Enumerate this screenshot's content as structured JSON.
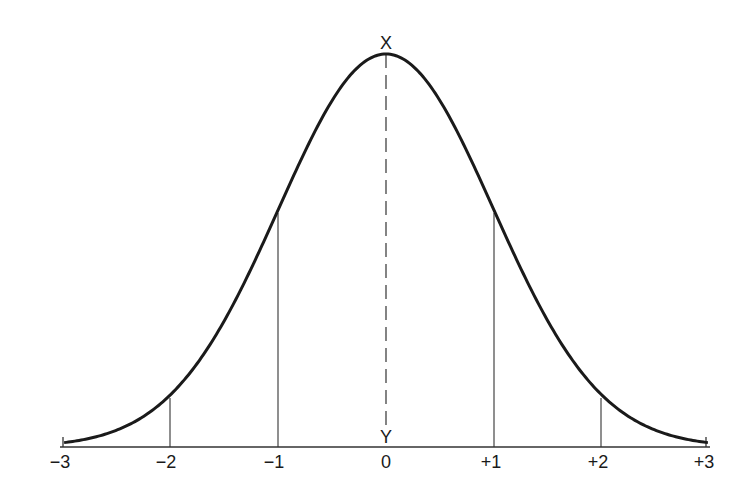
{
  "diagram": {
    "peak_label": "X",
    "baseline_label": "Y",
    "ticks": [
      {
        "label": "−3",
        "value": -3
      },
      {
        "label": "−2",
        "value": -2
      },
      {
        "label": "−1",
        "value": -1
      },
      {
        "label": "0",
        "value": 0
      },
      {
        "label": "+1",
        "value": 1
      },
      {
        "label": "+2",
        "value": 2
      },
      {
        "label": "+3",
        "value": 3
      }
    ],
    "colors": {
      "curve": "#1a1a1a",
      "lines": "#333333",
      "background": "#ffffff"
    }
  },
  "chart_data": {
    "type": "line",
    "xlabel": "",
    "ylabel": "",
    "x": [
      -3,
      -2,
      -1,
      0,
      1,
      2,
      3
    ],
    "xlim": [
      -3,
      3
    ],
    "vertical_markers": [
      -3,
      -2,
      -1,
      1,
      2,
      3
    ],
    "dashed_center_line": {
      "x": 0,
      "from_label": "X",
      "to_label": "Y"
    },
    "grid": false
  }
}
